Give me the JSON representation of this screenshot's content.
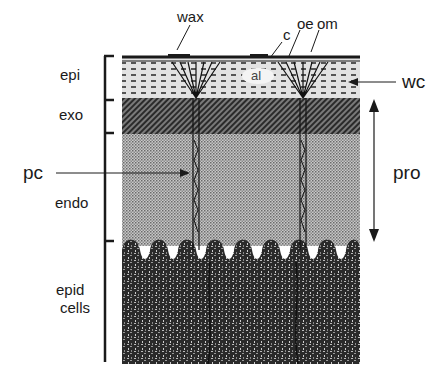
{
  "diagram": {
    "type": "cross-section",
    "labels": {
      "wax": "wax",
      "c": "c",
      "oe": "oe",
      "om": "om",
      "al": "al",
      "wc": "wc",
      "epi": "epi",
      "exo": "exo",
      "pc": "pc",
      "endo": "endo",
      "pro": "pro",
      "epid_line1": "epid",
      "epid_line2": "cells"
    },
    "layers": [
      {
        "name": "epi",
        "label": "epi"
      },
      {
        "name": "exo",
        "label": "exo"
      },
      {
        "name": "endo",
        "label": "endo"
      },
      {
        "name": "epid cells",
        "label": "epid cells"
      }
    ],
    "colors": {
      "ink": "#1a1a1a",
      "epi_fill": "#d8d8d8",
      "exo_fill": "#5a5a5a",
      "endo_fill": "#b4b4b4",
      "epid_fill": "#2e2e2e"
    }
  }
}
